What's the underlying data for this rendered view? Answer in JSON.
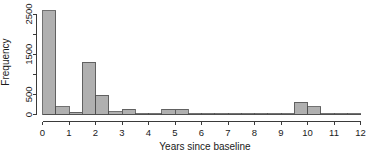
{
  "chart_data": {
    "type": "bar",
    "title": "",
    "subtitle": "",
    "xlabel": "Years since baseline",
    "ylabel": "Frequency",
    "xlim": [
      0,
      12
    ],
    "ylim": [
      0,
      2650
    ],
    "grid": false,
    "legend": null,
    "bin_width": 0.5,
    "x_ticks": [
      0,
      1,
      2,
      3,
      4,
      5,
      6,
      7,
      8,
      9,
      10,
      11,
      12
    ],
    "x_tick_labels": [
      "0",
      "1",
      "2",
      "3",
      "4",
      "5",
      "6",
      "7",
      "8",
      "9",
      "10",
      "11",
      "12"
    ],
    "y_ticks": [
      0,
      500,
      1000,
      1500,
      2000,
      2500
    ],
    "y_tick_labels": [
      "0",
      "500",
      "",
      "1500",
      "",
      "2500"
    ],
    "bar_color": "#b0b0b0",
    "bar_edge_color": "#4d4d4d",
    "axis_color": "#3a3a3a",
    "background_color": "#ffffff",
    "bins": [
      {
        "x0": 0.0,
        "x1": 0.5,
        "value": 2580
      },
      {
        "x0": 0.5,
        "x1": 1.0,
        "value": 190
      },
      {
        "x0": 1.0,
        "x1": 1.5,
        "value": 60
      },
      {
        "x0": 1.5,
        "x1": 2.0,
        "value": 1300
      },
      {
        "x0": 2.0,
        "x1": 2.5,
        "value": 480
      },
      {
        "x0": 2.5,
        "x1": 3.0,
        "value": 70
      },
      {
        "x0": 3.0,
        "x1": 3.5,
        "value": 130
      },
      {
        "x0": 3.5,
        "x1": 4.0,
        "value": 10
      },
      {
        "x0": 4.0,
        "x1": 4.5,
        "value": 8
      },
      {
        "x0": 4.5,
        "x1": 5.0,
        "value": 135
      },
      {
        "x0": 5.0,
        "x1": 5.5,
        "value": 135
      },
      {
        "x0": 5.5,
        "x1": 6.0,
        "value": 20
      },
      {
        "x0": 6.0,
        "x1": 6.5,
        "value": 18
      },
      {
        "x0": 6.5,
        "x1": 7.0,
        "value": 16
      },
      {
        "x0": 7.0,
        "x1": 7.5,
        "value": 14
      },
      {
        "x0": 7.5,
        "x1": 8.0,
        "value": 4
      },
      {
        "x0": 8.0,
        "x1": 8.5,
        "value": 3
      },
      {
        "x0": 8.5,
        "x1": 9.0,
        "value": 3
      },
      {
        "x0": 9.0,
        "x1": 9.5,
        "value": 12
      },
      {
        "x0": 9.5,
        "x1": 10.0,
        "value": 300
      },
      {
        "x0": 10.0,
        "x1": 10.5,
        "value": 195
      },
      {
        "x0": 10.5,
        "x1": 11.0,
        "value": 25
      },
      {
        "x0": 11.0,
        "x1": 11.5,
        "value": 18
      },
      {
        "x0": 11.5,
        "x1": 12.0,
        "value": 2
      }
    ]
  },
  "axes": {
    "x_title": "Years since baseline",
    "y_title": "Frequency"
  }
}
